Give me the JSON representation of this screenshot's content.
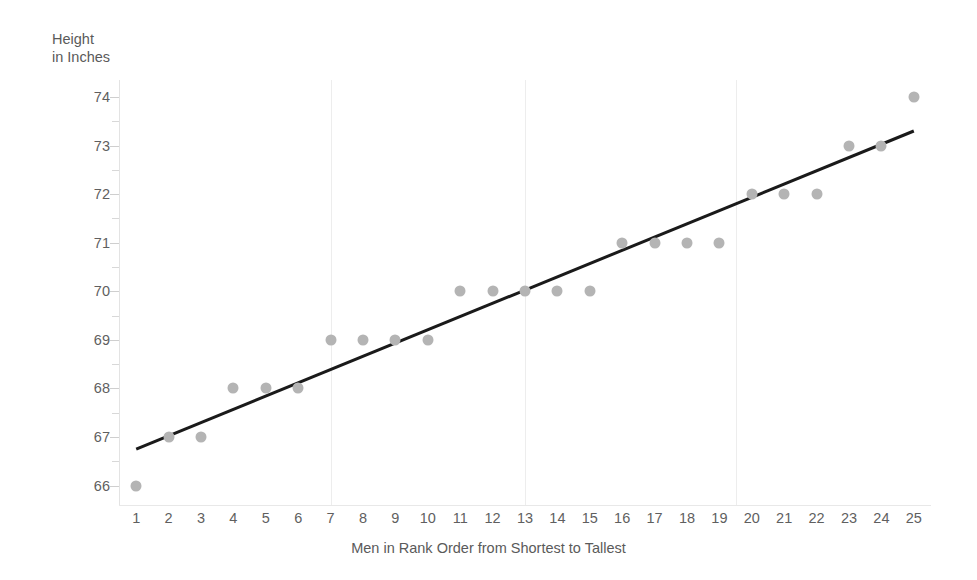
{
  "chart_data": {
    "type": "scatter",
    "title": "",
    "xlabel": "Men in Rank Order from Shortest to Tallest",
    "ylabel_line1": "Height",
    "ylabel_line2": "in Inches",
    "x": [
      1,
      2,
      3,
      4,
      5,
      6,
      7,
      8,
      9,
      10,
      11,
      12,
      13,
      14,
      15,
      16,
      17,
      18,
      19,
      20,
      21,
      22,
      23,
      24,
      25
    ],
    "values": [
      66,
      67,
      67,
      68,
      68,
      68,
      69,
      69,
      69,
      69,
      70,
      70,
      70,
      70,
      70,
      71,
      71,
      71,
      71,
      72,
      72,
      72,
      73,
      73,
      74
    ],
    "xtick_labels": [
      "1",
      "2",
      "3",
      "4",
      "5",
      "6",
      "7",
      "8",
      "9",
      "10",
      "11",
      "12",
      "13",
      "14",
      "15",
      "16",
      "17",
      "18",
      "19",
      "20",
      "21",
      "22",
      "23",
      "24",
      "25"
    ],
    "ytick_labels": [
      "74",
      "73",
      "72",
      "71",
      "70",
      "69",
      "68",
      "67",
      "66"
    ],
    "ytick_values": [
      74,
      73,
      72,
      71,
      70,
      69,
      68,
      67,
      66
    ],
    "xlim": [
      0.5,
      25.5
    ],
    "ylim": [
      65.6,
      74.35
    ],
    "grid": "vertical-only",
    "gridlines_x": [
      7,
      13,
      19.5
    ],
    "legend": "none",
    "series_name": "Height in Inches",
    "trendline": {
      "type": "linear",
      "x_start": 1.0,
      "y_start": 66.75,
      "x_end": 25.0,
      "y_end": 73.3,
      "slope": 0.273,
      "intercept": 66.477,
      "color": "#1a1a1a",
      "width_px": 3
    },
    "marker": {
      "shape": "circle",
      "color": "#b4b4b4",
      "size_px": 11
    },
    "axis_color": "#e3e3e3",
    "text_color": "#5a5a5a",
    "background": "#ffffff"
  }
}
